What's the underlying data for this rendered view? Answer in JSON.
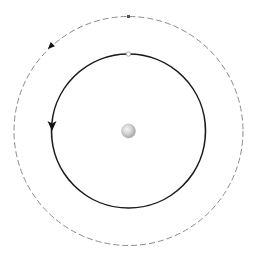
{
  "diagram": {
    "type": "orbit-diagram",
    "background": "#ffffff",
    "center_body": {
      "cx": 128.5,
      "cy": 131,
      "r": 7,
      "fill_light": "#f2f2f2",
      "fill_dark": "#a8a8a8"
    },
    "inner_orbit": {
      "cx": 128.5,
      "cy": 131,
      "r": 77,
      "style": "solid",
      "stroke": "#1a1a1a",
      "stroke_width": 1.6,
      "direction": "counterclockwise",
      "arrow_position": {
        "x": 52,
        "y": 127
      },
      "marker": {
        "x": 128.5,
        "y": 54,
        "r": 2.2,
        "fill": "#ffffff",
        "stroke": "#999999"
      }
    },
    "outer_orbit": {
      "cx": 128.5,
      "cy": 131,
      "r": 114.5,
      "style": "dashed",
      "stroke": "#888888",
      "stroke_width": 1,
      "dash": "6 3",
      "direction": "counterclockwise",
      "arrow_position": {
        "x": 49,
        "y": 47
      },
      "marker": {
        "x": 128.5,
        "y": 16.5
      }
    }
  }
}
